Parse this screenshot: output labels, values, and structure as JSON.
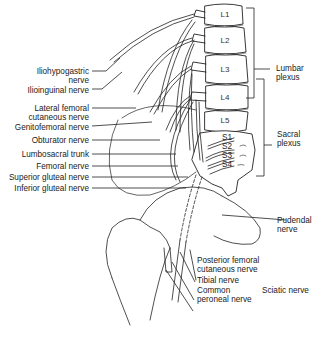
{
  "figure": {
    "vertebrae": [
      "L1",
      "L2",
      "L3",
      "L4",
      "L5"
    ],
    "sacral_roots": [
      "S1",
      "S2",
      "S3",
      "S4"
    ],
    "left_labels": [
      {
        "id": "iliohypogastric",
        "line1": "Iliohypogastric",
        "line2": "nerve"
      },
      {
        "id": "ilioinguinal",
        "line1": "Ilioinguinal nerve"
      },
      {
        "id": "lateral-femoral-cutaneous",
        "line1": "Lateral femoral",
        "line2": "cutaneous nerve"
      },
      {
        "id": "genitofemoral",
        "line1": "Genitofemoral nerve"
      },
      {
        "id": "obturator",
        "line1": "Obturator nerve"
      },
      {
        "id": "lumbosacral-trunk",
        "line1": "Lumbosacral trunk"
      },
      {
        "id": "femoral",
        "line1": "Femoral nerve"
      },
      {
        "id": "superior-gluteal",
        "line1": "Superior gluteal nerve"
      },
      {
        "id": "inferior-gluteal",
        "line1": "Inferior gluteal nerve"
      }
    ],
    "right_labels": {
      "lumbar_plexus": {
        "line1": "Lumbar",
        "line2": "plexus"
      },
      "sacral_plexus": {
        "line1": "Sacral",
        "line2": "plexus"
      },
      "pudendal": {
        "line1": "Pudendal",
        "line2": "nerve"
      }
    },
    "bottom_labels": {
      "posterior_femoral_cutaneous": {
        "line1": "Posterior femoral",
        "line2": "cutaneous nerve"
      },
      "tibial": {
        "line1": "Tibial nerve"
      },
      "common_peroneal": {
        "line1": "Common",
        "line2": "peroneal nerve"
      },
      "sciatic": {
        "line1": "Sciatic nerve"
      }
    }
  }
}
